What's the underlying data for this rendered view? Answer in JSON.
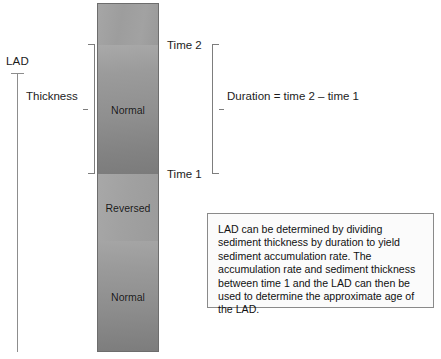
{
  "figure": {
    "axis": {
      "lad_label": "LAD"
    },
    "column": {
      "segments": [
        {
          "name": "top-unlabeled",
          "label": ""
        },
        {
          "name": "normal-upper",
          "label": "Normal"
        },
        {
          "name": "reversed",
          "label": "Reversed"
        },
        {
          "name": "normal-lower",
          "label": "Normal"
        }
      ]
    },
    "annotations": {
      "thickness_label": "Thickness",
      "duration_label": "Duration = time 2 – time 1",
      "time_2_label": "Time 2",
      "time_1_label": "Time 1"
    },
    "note": {
      "text": "LAD can be determined by dividing sediment thickness by duration to yield sediment accumulation rate. The accumulation rate and sediment thickness between time 1 and the LAD can then be used to determine the approximate age of the LAD."
    },
    "colors": {
      "page_background": "#ffffff",
      "column_outline": "#6d6d6d",
      "bracket_line": "#7d7d7d",
      "axis_line": "#8d8d8d",
      "note_border": "#8a8a8a",
      "note_fill": "#fbfbfb",
      "text": "#1c1c1c"
    }
  }
}
